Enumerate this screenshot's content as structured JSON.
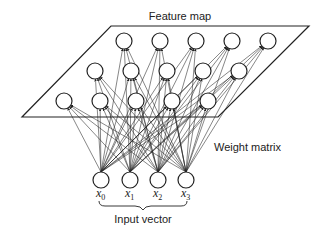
{
  "diagram": {
    "title": "Feature map",
    "weight_label": "Weight matrix",
    "input_label": "Input vector",
    "plane": {
      "points": [
        [
          111,
          26
        ],
        [
          309,
          26
        ],
        [
          218,
          117
        ],
        [
          22,
          117
        ]
      ],
      "stroke": "#222222"
    },
    "feature_nodes": {
      "radius": 8,
      "rows": [
        {
          "name": "top",
          "nodes": [
            [
              124,
              41
            ],
            [
              160,
              41
            ],
            [
              196,
              41
            ],
            [
              232,
              41
            ],
            [
              268,
              41
            ]
          ]
        },
        {
          "name": "middle",
          "nodes": [
            [
              95,
              71
            ],
            [
              131,
              71
            ],
            [
              167,
              71
            ],
            [
              203,
              71
            ],
            [
              239,
              71
            ]
          ]
        },
        {
          "name": "bottom",
          "nodes": [
            [
              64,
              101
            ],
            [
              100,
              101
            ],
            [
              136,
              101
            ],
            [
              172,
              101
            ],
            [
              208,
              101
            ]
          ]
        }
      ]
    },
    "input_nodes": {
      "radius": 8,
      "items": [
        {
          "label": "x",
          "sub": "0",
          "cx": 101,
          "cy": 180
        },
        {
          "label": "x",
          "sub": "1",
          "cx": 130,
          "cy": 180
        },
        {
          "label": "x",
          "sub": "2",
          "cx": 158,
          "cy": 180
        },
        {
          "label": "x",
          "sub": "3",
          "cx": 186,
          "cy": 180
        }
      ]
    },
    "colors": {
      "line": "#222222",
      "text": "#222222",
      "background": "#ffffff"
    }
  }
}
